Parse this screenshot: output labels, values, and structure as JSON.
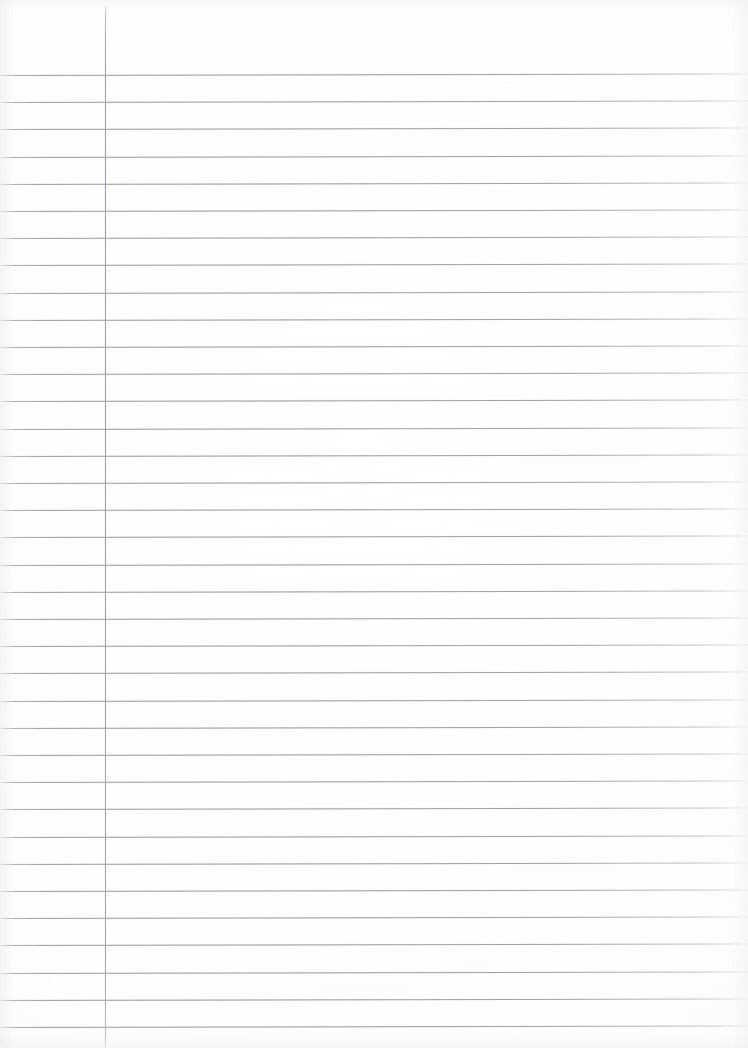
{
  "document": {
    "kind": "scanned-lined-notebook-page",
    "page_width": 748,
    "page_height": 1048,
    "paper_color": "#ffffff",
    "written_content": "",
    "visible_text": ""
  },
  "ruling": {
    "horizontal_line_color": "#9a9aa2",
    "horizontal_line_count": 36,
    "first_line_y": 75,
    "line_spacing": 27.2,
    "line_thickness": 1,
    "line_tilt_degrees": -0.12,
    "line_start_x": 0,
    "line_end_x": 748
  },
  "margin": {
    "vertical_line_color": "#9a9aa2",
    "vertical_line_x": 105,
    "vertical_line_top": 5,
    "vertical_line_bottom": 1048,
    "vertical_line_thickness": 1
  }
}
